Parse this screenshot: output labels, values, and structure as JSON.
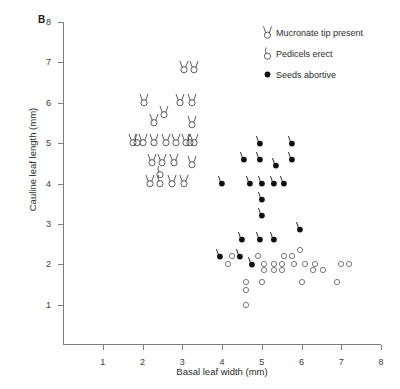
{
  "panel": {
    "label": "B"
  },
  "legend": {
    "position": "top-right",
    "entries": [
      {
        "symbol": "mucronate-tip-icon",
        "label": "Mucronate tip present"
      },
      {
        "symbol": "pedicels-erect-icon",
        "label": "Pedicels erect"
      },
      {
        "symbol": "seeds-abortive-icon",
        "label": "Seeds abortive"
      }
    ]
  },
  "chart_data": {
    "type": "scatter",
    "title": "",
    "xlabel": "Basal leaf width (mm)",
    "ylabel": "Cauline leaf length (mm)",
    "xlim": [
      0,
      8
    ],
    "ylim": [
      0,
      8
    ],
    "xticks": [
      1,
      2,
      3,
      4,
      5,
      6,
      7,
      8
    ],
    "yticks": [
      1,
      2,
      3,
      4,
      5,
      6,
      7,
      8
    ],
    "grid": false,
    "series": [
      {
        "name": "Mucronate tip present",
        "symbol": "open circle with two erect bristles",
        "points": [
          [
            3.05,
            6.8
          ],
          [
            3.3,
            6.8
          ],
          [
            2.05,
            6.0
          ],
          [
            2.95,
            6.0
          ],
          [
            3.25,
            6.0
          ],
          [
            2.55,
            5.7
          ],
          [
            2.3,
            5.5
          ],
          [
            3.25,
            5.45
          ],
          [
            1.75,
            5.0
          ],
          [
            2.0,
            5.0
          ],
          [
            2.3,
            5.0
          ],
          [
            2.6,
            5.0
          ],
          [
            2.85,
            5.0
          ],
          [
            3.1,
            5.0
          ],
          [
            3.3,
            5.0
          ],
          [
            2.25,
            4.5
          ],
          [
            2.5,
            4.5
          ],
          [
            2.8,
            4.5
          ],
          [
            3.25,
            4.45
          ],
          [
            2.2,
            4.0
          ],
          [
            2.75,
            4.0
          ],
          [
            3.05,
            4.0
          ]
        ]
      },
      {
        "name": "Pedicels erect",
        "symbol": "open circle with one erect bristle",
        "points": [
          [
            2.45,
            4.2
          ],
          [
            2.45,
            4.0
          ],
          [
            1.85,
            5.0
          ],
          [
            3.2,
            5.0
          ]
        ]
      },
      {
        "name": "Seeds abortive",
        "symbol": "filled circle",
        "points": [
          [
            4.95,
            5.0
          ],
          [
            5.75,
            5.0
          ],
          [
            4.55,
            4.6
          ],
          [
            4.95,
            4.6
          ],
          [
            5.35,
            4.45
          ],
          [
            5.75,
            4.6
          ],
          [
            4.0,
            4.0
          ],
          [
            4.7,
            4.0
          ],
          [
            5.0,
            4.0
          ],
          [
            5.3,
            4.0
          ],
          [
            5.55,
            4.0
          ],
          [
            5.0,
            3.6
          ],
          [
            5.0,
            3.2
          ],
          [
            4.5,
            2.6
          ],
          [
            4.95,
            2.6
          ],
          [
            5.3,
            2.6
          ],
          [
            5.95,
            2.85
          ],
          [
            3.95,
            2.2
          ],
          [
            4.45,
            2.2
          ],
          [
            4.75,
            2.0
          ]
        ]
      },
      {
        "name": "Open circles (no character)",
        "symbol": "open circle",
        "points": [
          [
            4.6,
            1.0
          ],
          [
            4.25,
            2.2
          ],
          [
            4.9,
            2.2
          ],
          [
            5.55,
            2.2
          ],
          [
            5.75,
            2.2
          ],
          [
            5.95,
            2.35
          ],
          [
            4.15,
            2.0
          ],
          [
            5.05,
            2.0
          ],
          [
            5.3,
            2.0
          ],
          [
            5.5,
            2.0
          ],
          [
            5.05,
            1.85
          ],
          [
            5.3,
            1.85
          ],
          [
            5.5,
            1.85
          ],
          [
            5.8,
            2.0
          ],
          [
            6.1,
            2.0
          ],
          [
            6.35,
            2.0
          ],
          [
            6.3,
            1.85
          ],
          [
            6.55,
            1.85
          ],
          [
            7.0,
            2.0
          ],
          [
            7.2,
            2.0
          ],
          [
            4.6,
            1.55
          ],
          [
            5.0,
            1.55
          ],
          [
            6.0,
            1.55
          ],
          [
            6.9,
            1.55
          ],
          [
            4.6,
            1.35
          ]
        ]
      }
    ]
  }
}
